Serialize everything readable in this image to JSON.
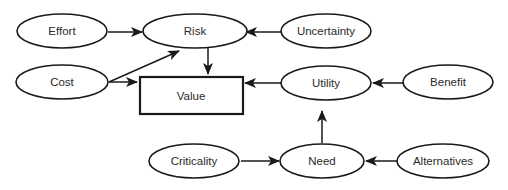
{
  "diagram": {
    "type": "influence-diagram",
    "nodes": [
      {
        "id": "effort",
        "label": "Effort",
        "shape": "ellipse"
      },
      {
        "id": "risk",
        "label": "Risk",
        "shape": "ellipse"
      },
      {
        "id": "uncertainty",
        "label": "Uncertainty",
        "shape": "ellipse"
      },
      {
        "id": "cost",
        "label": "Cost",
        "shape": "ellipse"
      },
      {
        "id": "value",
        "label": "Value",
        "shape": "rectangle"
      },
      {
        "id": "utility",
        "label": "Utility",
        "shape": "ellipse"
      },
      {
        "id": "benefit",
        "label": "Benefit",
        "shape": "ellipse"
      },
      {
        "id": "criticality",
        "label": "Criticality",
        "shape": "ellipse"
      },
      {
        "id": "need",
        "label": "Need",
        "shape": "ellipse"
      },
      {
        "id": "alternatives",
        "label": "Alternatives",
        "shape": "ellipse"
      }
    ],
    "edges": [
      {
        "from": "effort",
        "to": "risk"
      },
      {
        "from": "uncertainty",
        "to": "risk"
      },
      {
        "from": "cost",
        "to": "risk"
      },
      {
        "from": "cost",
        "to": "value"
      },
      {
        "from": "risk",
        "to": "value"
      },
      {
        "from": "utility",
        "to": "value"
      },
      {
        "from": "benefit",
        "to": "utility"
      },
      {
        "from": "need",
        "to": "utility"
      },
      {
        "from": "criticality",
        "to": "need"
      },
      {
        "from": "alternatives",
        "to": "need"
      }
    ],
    "colors": {
      "stroke": "#1a1a1a",
      "fill": "#ffffff",
      "text": "#2a2a2a"
    }
  }
}
